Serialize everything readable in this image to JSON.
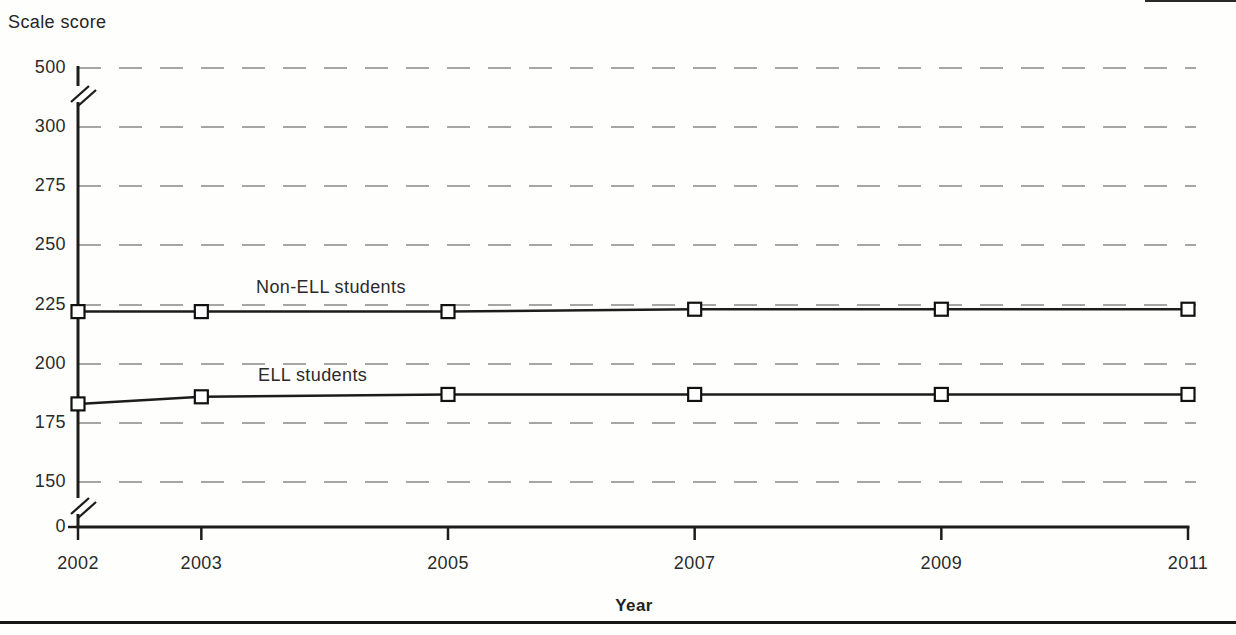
{
  "figure": {
    "y_axis_title": "Scale score",
    "x_axis_title": "Year",
    "grid_color": "#969696",
    "line_color": "#1c1c1c",
    "background": "#fefefd"
  },
  "chart_data": {
    "type": "line",
    "title": "",
    "xlabel": "Year",
    "ylabel": "Scale score",
    "x": [
      2002,
      2003,
      2005,
      2007,
      2009,
      2011
    ],
    "series": [
      {
        "name": "Non-ELL students",
        "values": [
          222,
          222,
          222,
          223,
          223,
          223
        ]
      },
      {
        "name": "ELL students",
        "values": [
          183,
          186,
          187,
          187,
          187,
          187
        ]
      }
    ],
    "y_ticks": [
      0,
      150,
      175,
      200,
      225,
      250,
      275,
      300,
      500
    ],
    "y_tick_labels": [
      "0",
      "150",
      "175",
      "200",
      "225",
      "250",
      "275",
      "300",
      "500"
    ],
    "x_tick_labels": [
      "2002",
      "2003",
      "2005",
      "2007",
      "2009",
      "2011"
    ],
    "y_axis_breaks": [
      [
        0,
        150
      ],
      [
        300,
        500
      ]
    ],
    "marker": "open-square",
    "grid": "dashed-horizontal",
    "legend_position": "labels-above-lines",
    "ylim_segments": "0, then 150-300 linear, then 500"
  }
}
